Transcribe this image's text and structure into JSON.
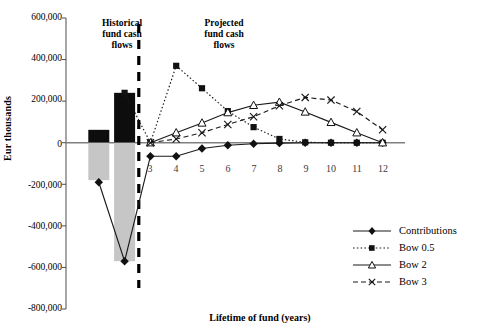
{
  "chart_data": {
    "type": "line",
    "title": "",
    "xlabel": "Lifetime of fund (years)",
    "ylabel": "Eur thousands",
    "xlim": [
      0,
      12.8
    ],
    "ylim": [
      -800000,
      600000
    ],
    "ytick_labels": [
      "600,000",
      "400,000",
      "200,000",
      "0",
      "-200,000",
      "-400,000",
      "-600,000",
      "-800,000"
    ],
    "ytick_values": [
      600000,
      400000,
      200000,
      0,
      -200000,
      -400000,
      -600000,
      -800000
    ],
    "xtick_labels": [
      "1",
      "2",
      "3",
      "4",
      "5",
      "6",
      "7",
      "8",
      "9",
      "10",
      "11",
      "12"
    ],
    "xtick_values": [
      1,
      2,
      3,
      4,
      5,
      6,
      7,
      8,
      9,
      10,
      11,
      12
    ],
    "grid": false,
    "legend_position": "bottom-right",
    "annotations": [
      {
        "name": "historical-label",
        "text": "Historical\nfund cash\nflows",
        "line1": "Historical",
        "line2": "fund cash",
        "line3": "flows"
      },
      {
        "name": "projected-label",
        "text": "Projected\nfund cash\nflows",
        "line1": "Projected",
        "line2": "fund cash",
        "line3": "flows"
      },
      {
        "name": "divider",
        "text": "",
        "x": 2.55,
        "style": "dashed-vertical"
      }
    ],
    "bars": [
      {
        "label": "1",
        "x": 1,
        "positive": 62000,
        "negative": -180000
      },
      {
        "label": "2",
        "x": 2,
        "positive": 240000,
        "negative": -570000
      }
    ],
    "series": [
      {
        "name": "Contributions",
        "marker": "diamond",
        "line": "solid",
        "x": [
          1,
          2,
          3,
          4,
          5,
          6,
          7,
          8,
          9,
          10,
          11,
          12
        ],
        "values": [
          -190000,
          -570000,
          -65000,
          -65000,
          -28000,
          -12000,
          -5000,
          -2000,
          0,
          0,
          0,
          0
        ]
      },
      {
        "name": "Bow 0.5",
        "marker": "square",
        "line": "dotted",
        "x": [
          2,
          3,
          4,
          5,
          6,
          7,
          8,
          9,
          10,
          11,
          12
        ],
        "values": [
          240000,
          0,
          370000,
          262000,
          152000,
          75000,
          18000,
          2000,
          0,
          0,
          0
        ]
      },
      {
        "name": "Bow 2",
        "marker": "triangle",
        "line": "solid",
        "x": [
          3,
          4,
          5,
          6,
          7,
          8,
          9,
          10,
          11,
          12
        ],
        "values": [
          0,
          48000,
          95000,
          145000,
          180000,
          195000,
          148000,
          98000,
          48000,
          0
        ]
      },
      {
        "name": "Bow 3",
        "marker": "x",
        "line": "dashed",
        "x": [
          3,
          4,
          5,
          6,
          7,
          8,
          9,
          10,
          11,
          12
        ],
        "values": [
          0,
          18000,
          48000,
          88000,
          125000,
          178000,
          218000,
          205000,
          150000,
          62000
        ]
      }
    ],
    "legend_entries": [
      {
        "label": "Contributions",
        "marker": "diamond",
        "line": "solid"
      },
      {
        "label": "Bow 0.5",
        "marker": "square",
        "line": "dotted"
      },
      {
        "label": "Bow 2",
        "marker": "triangle",
        "line": "solid"
      },
      {
        "label": "Bow 3",
        "marker": "x",
        "line": "dashed"
      }
    ],
    "colors": {
      "axis": "#4d4d4d",
      "bar_positive": "#0d0d0d",
      "bar_negative": "#c6c6c6",
      "series": "#1a1a1a",
      "zero_line": "#808080"
    }
  }
}
